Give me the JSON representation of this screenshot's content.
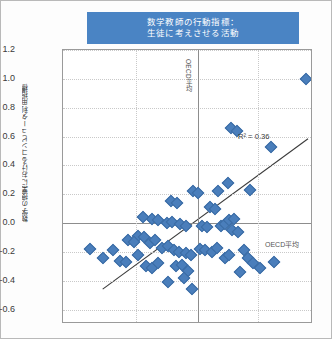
{
  "chart_data": {
    "type": "scatter",
    "title_line1": "数学教師の行動指標：",
    "title_line2": "生徒に考えさせる活動",
    "xlabel": "",
    "ylabel": "数学の授業におけるコンピュータ利用指標",
    "ylim": [
      -0.7,
      1.2
    ],
    "xlim": [
      -1.35,
      1.15
    ],
    "yticks": [
      "1.2",
      "1.0",
      "0.8",
      "0.6",
      "0.4",
      "0.2",
      "0.0",
      "-0.2",
      "-0.4",
      "-0.6"
    ],
    "ytick_values": [
      1.2,
      1.0,
      0.8,
      0.6,
      0.4,
      0.2,
      0.0,
      -0.2,
      -0.4,
      -0.6
    ],
    "xtick_labels": [],
    "grid": true,
    "legend": "none",
    "marker": "diamond",
    "marker_color": "#4a7ebb",
    "annotations": [
      {
        "name": "oecd-average-vertical",
        "text": "OECD平均",
        "orientation": "vertical",
        "at_x": 0.0
      },
      {
        "name": "oecd-average-horizontal",
        "text": "OECD平均",
        "orientation": "horizontal",
        "at_y": 0.0
      },
      {
        "name": "r-squared",
        "text": "R² = 0.36"
      }
    ],
    "r_squared": 0.36,
    "trendline": {
      "x0": -0.95,
      "y0": -0.47,
      "x1": 1.12,
      "y1": 0.58
    },
    "points": [
      [
        1.08,
        1.0
      ],
      [
        0.33,
        0.66
      ],
      [
        0.39,
        0.64
      ],
      [
        0.3,
        0.28
      ],
      [
        0.73,
        0.53
      ],
      [
        -0.05,
        0.22
      ],
      [
        0.0,
        0.21
      ],
      [
        0.2,
        0.22
      ],
      [
        -0.27,
        0.15
      ],
      [
        -0.21,
        0.14
      ],
      [
        0.12,
        0.11
      ],
      [
        0.17,
        0.1
      ],
      [
        0.52,
        0.23
      ],
      [
        -0.46,
        0.03
      ],
      [
        -0.4,
        0.02
      ],
      [
        -0.31,
        0.0
      ],
      [
        -0.26,
        0.01
      ],
      [
        -0.18,
        -0.01
      ],
      [
        -0.12,
        -0.02
      ],
      [
        -0.55,
        0.04
      ],
      [
        0.04,
        -0.02
      ],
      [
        0.09,
        -0.03
      ],
      [
        0.23,
        -0.02
      ],
      [
        0.27,
        -0.01
      ],
      [
        0.31,
        0.02
      ],
      [
        0.36,
        0.03
      ],
      [
        0.34,
        -0.05
      ],
      [
        0.4,
        -0.06
      ],
      [
        -0.6,
        -0.09
      ],
      [
        -0.54,
        -0.1
      ],
      [
        -0.7,
        -0.12
      ],
      [
        -0.64,
        -0.13
      ],
      [
        -0.48,
        -0.14
      ],
      [
        -0.43,
        -0.12
      ],
      [
        -0.36,
        -0.17
      ],
      [
        -0.3,
        -0.16
      ],
      [
        -0.24,
        -0.19
      ],
      [
        -0.19,
        -0.2
      ],
      [
        -0.12,
        -0.21
      ],
      [
        -0.07,
        -0.22
      ],
      [
        0.02,
        -0.18
      ],
      [
        0.07,
        -0.19
      ],
      [
        0.14,
        -0.2
      ],
      [
        0.19,
        -0.17
      ],
      [
        0.46,
        -0.19
      ],
      [
        0.5,
        -0.24
      ],
      [
        0.55,
        -0.28
      ],
      [
        -0.85,
        -0.19
      ],
      [
        -1.08,
        -0.18
      ],
      [
        -0.95,
        -0.24
      ],
      [
        -0.78,
        -0.26
      ],
      [
        -0.72,
        -0.27
      ],
      [
        -0.52,
        -0.3
      ],
      [
        -0.46,
        -0.31
      ],
      [
        -0.4,
        -0.28
      ],
      [
        -0.22,
        -0.3
      ],
      [
        -0.16,
        -0.29
      ],
      [
        -0.1,
        -0.33
      ],
      [
        0.62,
        -0.31
      ],
      [
        0.76,
        -0.27
      ],
      [
        -0.3,
        -0.41
      ],
      [
        -0.14,
        -0.38
      ],
      [
        -0.06,
        -0.46
      ],
      [
        0.27,
        -0.24
      ],
      [
        0.31,
        -0.22
      ],
      [
        -0.6,
        -0.22
      ],
      [
        0.42,
        -0.34
      ]
    ]
  }
}
